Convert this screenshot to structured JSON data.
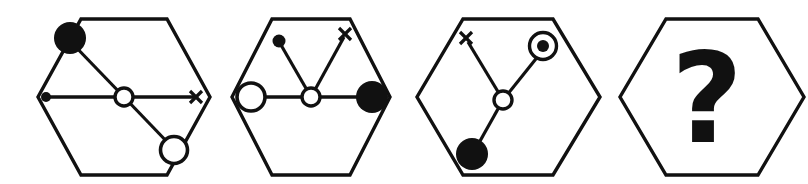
{
  "figure": {
    "background_color": "#ffffff",
    "stroke_color": "#111111",
    "fill_color": "#111111",
    "canvas": {
      "width": 808,
      "height": 184
    }
  },
  "legend": {
    "node_types": {
      "small-filled-dot": "small solid black dot",
      "large-filled-circle": "large solid black circle",
      "small-open-circle": "small white circle with black outline",
      "large-open-circle": "large white circle with black outline",
      "cross-mark": "x shaped cross mark",
      "bullseye": "open circle containing a solid black dot"
    }
  },
  "panels": [
    {
      "id": "panel-1",
      "index": 1,
      "label": "1",
      "hexagon": {
        "cx": 124,
        "cy": 97,
        "rx": 86,
        "ry": 78
      },
      "hub": {
        "x": 124,
        "y": 97,
        "type": "small-open-circle",
        "r": 9
      },
      "branches": [
        {
          "name": "upper-left-branch",
          "angle_deg": 125,
          "endpoint": {
            "x": 70,
            "y": 38
          },
          "node": "large-filled-circle",
          "r": 16
        },
        {
          "name": "left-branch",
          "angle_deg": 180,
          "endpoint": {
            "x": 46,
            "y": 97
          },
          "node": "small-filled-dot",
          "r": 5
        },
        {
          "name": "right-branch",
          "angle_deg": 0,
          "endpoint": {
            "x": 196,
            "y": 97
          },
          "node": "cross-mark",
          "r": 7
        },
        {
          "name": "lower-right-branch",
          "angle_deg": 305,
          "endpoint": {
            "x": 172,
            "y": 149
          },
          "node": "large-open-circle",
          "r": 14
        }
      ]
    },
    {
      "id": "panel-2",
      "index": 2,
      "label": "2",
      "hexagon": {
        "cx": 311,
        "cy": 97,
        "rx": 79,
        "ry": 78
      },
      "hub": {
        "x": 311,
        "y": 97,
        "type": "small-open-circle",
        "r": 9
      },
      "branches": [
        {
          "name": "upper-left-branch",
          "angle_deg": 112,
          "endpoint": {
            "x": 280,
            "y": 42
          },
          "node": "small-filled-dot",
          "r": 6
        },
        {
          "name": "upper-right-branch",
          "angle_deg": 65,
          "endpoint": {
            "x": 345,
            "y": 34
          },
          "node": "cross-mark",
          "r": 7
        },
        {
          "name": "left-branch",
          "angle_deg": 180,
          "endpoint": {
            "x": 248,
            "y": 97
          },
          "node": "large-open-circle",
          "r": 14
        },
        {
          "name": "right-branch",
          "angle_deg": 0,
          "endpoint": {
            "x": 372,
            "y": 97
          },
          "node": "large-filled-circle",
          "r": 16
        }
      ]
    },
    {
      "id": "panel-3",
      "index": 3,
      "label": "3",
      "hexagon": {
        "cx": 507,
        "cy": 97,
        "rx": 90,
        "ry": 78
      },
      "hub": {
        "x": 503,
        "y": 100,
        "type": "small-open-circle",
        "r": 9
      },
      "branches": [
        {
          "name": "upper-left-branch",
          "angle_deg": 117,
          "endpoint": {
            "x": 466,
            "y": 39
          },
          "node": "cross-mark",
          "r": 7
        },
        {
          "name": "upper-right-branch",
          "angle_deg": 58,
          "endpoint": {
            "x": 542,
            "y": 44
          },
          "node": "bullseye",
          "r": 14
        },
        {
          "name": "lower-left-branch",
          "angle_deg": 249,
          "endpoint": {
            "x": 473,
            "y": 152
          },
          "node": "large-filled-circle",
          "r": 16
        }
      ]
    },
    {
      "id": "panel-4",
      "index": 4,
      "label": "4",
      "hexagon": {
        "cx": 712,
        "cy": 97,
        "rx": 92,
        "ry": 78
      },
      "content": "question-mark",
      "question_mark": {
        "glyph": "?",
        "x": 707,
        "y": 100,
        "font_size": 118
      }
    }
  ]
}
